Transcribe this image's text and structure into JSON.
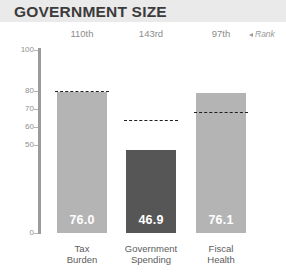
{
  "header": {
    "title": "GOVERNMENT SIZE",
    "background": "#eaeaea",
    "title_color": "#3b3b3b"
  },
  "rank_legend": {
    "label": "Rank",
    "arrow_icon": "left-triangle-icon"
  },
  "colors": {
    "bar_light": "#b4b4b4",
    "bar_dark": "#565656",
    "axis": "#9b9b9b",
    "dash": "#1f1f1f",
    "value_text": "#ffffff",
    "tick_text": "#8f8f8f",
    "category_text": "#5c5c5c",
    "rank_text": "#8c8c8c"
  },
  "chart_data": {
    "type": "bar",
    "title": "GOVERNMENT SIZE",
    "xlabel": "",
    "ylabel": "",
    "grid": false,
    "legend_position": "top-right",
    "ylim": [
      0,
      100
    ],
    "ytick_labels": [
      "100",
      "80",
      "70",
      "60",
      "50",
      "0"
    ],
    "ytick_values": [
      100,
      80,
      70,
      60,
      50,
      0
    ],
    "axis_note": "broken / non-linear y axis",
    "categories": [
      "Tax\nBurden",
      "Government\nSpending",
      "Fiscal\nHealth"
    ],
    "values": [
      76.0,
      46.9,
      76.1
    ],
    "value_labels": [
      "76.0",
      "46.9",
      "76.1"
    ],
    "ranks": [
      "110th",
      "143rd",
      "97th"
    ],
    "series": [
      {
        "name": "Score",
        "values": [
          76.0,
          46.9,
          76.1
        ]
      },
      {
        "name": "World Average (dashed)",
        "values": [
          76.3,
          63.5,
          67.5
        ]
      }
    ],
    "bar_colors": [
      "#b4b4b4",
      "#565656",
      "#b4b4b4"
    ]
  },
  "bars": [
    {
      "key": "tax-burden",
      "category_label": "Tax\nBurden",
      "rank": "110th",
      "value_label": "76.0",
      "value": 76.0,
      "average": 76.3,
      "color": "#b4b4b4",
      "left": 57,
      "width": 50,
      "top_px": 92,
      "dash_px": 91
    },
    {
      "key": "government-spending",
      "category_label": "Government\nSpending",
      "rank": "143rd",
      "value_label": "46.9",
      "value": 46.9,
      "average": 63.5,
      "color": "#565656",
      "left": 126,
      "width": 50,
      "top_px": 150,
      "dash_px": 120
    },
    {
      "key": "fiscal-health",
      "category_label": "Fiscal\nHealth",
      "rank": "97th",
      "value_label": "76.1",
      "value": 76.1,
      "average": 67.5,
      "color": "#b4b4b4",
      "left": 196,
      "width": 50,
      "top_px": 93,
      "dash_px": 112
    }
  ],
  "y_axis": {
    "ticks": [
      {
        "label": "100",
        "y": 50
      },
      {
        "label": "80",
        "y": 91
      },
      {
        "label": "70",
        "y": 109
      },
      {
        "label": "60",
        "y": 127
      },
      {
        "label": "50",
        "y": 145
      },
      {
        "label": "0",
        "y": 233
      }
    ]
  }
}
